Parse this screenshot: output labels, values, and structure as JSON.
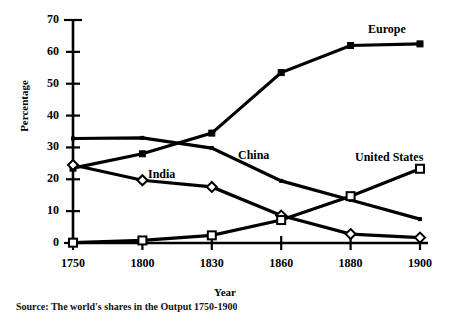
{
  "chart_data": {
    "type": "line",
    "title": "",
    "xlabel": "Year",
    "ylabel": "Percentage",
    "categories": [
      "1750",
      "1800",
      "1830",
      "1860",
      "1880",
      "1900"
    ],
    "xlim": [
      "1750",
      "1900"
    ],
    "ylim": [
      0,
      70
    ],
    "yticks": [
      0,
      10,
      20,
      30,
      40,
      50,
      60,
      70
    ],
    "grid": false,
    "legend": "inline-labels",
    "series": [
      {
        "name": "Europe",
        "marker": "filled-square",
        "values": [
          23.5,
          28,
          34.5,
          53.5,
          62,
          62.5
        ],
        "label_x": 368,
        "label_y": 22
      },
      {
        "name": "China",
        "marker": "small-dot",
        "values": [
          32.8,
          33.0,
          29.8,
          19.5,
          13.5,
          7.5
        ],
        "label_x": 238,
        "label_y": 148
      },
      {
        "name": "India",
        "marker": "open-diamond",
        "values": [
          24.5,
          19.7,
          17.6,
          8.6,
          2.8,
          1.7
        ],
        "label_x": 148,
        "label_y": 167
      },
      {
        "name": "United States",
        "marker": "open-square",
        "values": [
          0.1,
          0.8,
          2.4,
          7.2,
          14.7,
          23.3
        ],
        "label_x": 355,
        "label_y": 150
      }
    ]
  },
  "axis": {
    "y_tick_labels": [
      "70",
      "60",
      "50",
      "40",
      "30",
      "20",
      "10",
      "0"
    ],
    "x_tick_labels": [
      "1750",
      "1800",
      "1830",
      "1860",
      "1880",
      "1900"
    ],
    "ylabel": "Percentage",
    "xlabel": "Year"
  },
  "caption": {
    "text": "Source: The world's shares in the Output 1750-1900"
  }
}
